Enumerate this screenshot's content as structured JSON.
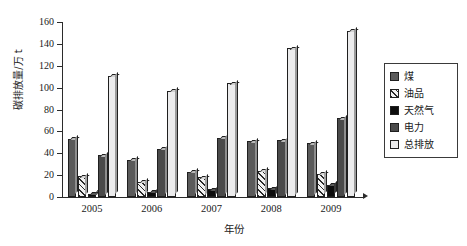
{
  "chart_data": {
    "type": "bar",
    "title": "",
    "subtitle": "",
    "xlabel": "年份",
    "ylabel": "碳排放量/万 t",
    "categories": [
      "2005",
      "2006",
      "2007",
      "2008",
      "2009"
    ],
    "ylim": [
      0,
      160
    ],
    "ytick_values": [
      0,
      20,
      40,
      60,
      80,
      100,
      120,
      140,
      160
    ],
    "ytick_labels": [
      "0",
      "20",
      "40",
      "60",
      "80",
      "100",
      "120",
      "140",
      "160"
    ],
    "grid": false,
    "legend_position": "right",
    "series": [
      {
        "name": "煤",
        "key": "coal",
        "swatch": "dark-gray-3d",
        "color": "#5a5a5a",
        "values": [
          53,
          34,
          23,
          51,
          49
        ]
      },
      {
        "name": "油品",
        "key": "oil",
        "swatch": "hatched-white",
        "color": "#f2f2f2",
        "values": [
          19,
          14,
          18,
          24,
          21
        ]
      },
      {
        "name": "天然气",
        "key": "gas",
        "swatch": "black",
        "color": "#0d0d0d",
        "values": [
          3,
          5,
          7,
          8,
          11
        ]
      },
      {
        "name": "电力",
        "key": "power",
        "swatch": "dark-gray",
        "color": "#4a4a4a",
        "values": [
          38,
          44,
          54,
          52,
          72
        ]
      },
      {
        "name": "总排放",
        "key": "total",
        "swatch": "white",
        "color": "#ececed",
        "values": [
          111,
          97,
          104,
          136,
          152
        ]
      }
    ]
  },
  "axis": {
    "y_title": "碳排放量/万 t",
    "x_title": "年份"
  },
  "legend": {
    "entries": [
      {
        "label": "煤"
      },
      {
        "label": "油品"
      },
      {
        "label": "天然气"
      },
      {
        "label": "电力"
      },
      {
        "label": "总排放"
      }
    ]
  }
}
